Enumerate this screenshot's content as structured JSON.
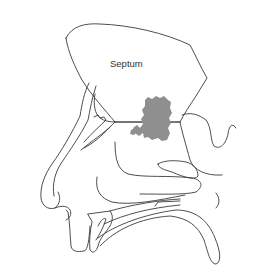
{
  "diagram": {
    "type": "anatomical-sagittal-section",
    "labels": [
      {
        "id": "septum",
        "text": "Septum"
      }
    ],
    "highlight": {
      "description": "shaded lesion region on septum",
      "color": "#8f8f8f"
    },
    "line_color": "#3a3a3a",
    "background": "#ffffff"
  }
}
